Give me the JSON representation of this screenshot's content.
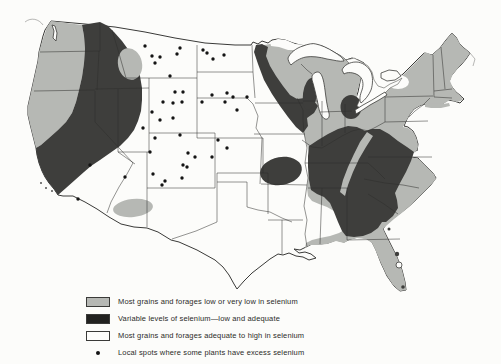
{
  "figure": {
    "map_type": "shaded-area map of the conterminous United States",
    "colors": {
      "low_or_very_low": "#b6b8b4",
      "variable": "#3e3e3c",
      "adequate_to_high": "#fcfcfa",
      "excess_spot": "#141414",
      "outline": "#3a3a38"
    },
    "legend": [
      {
        "swatch": "gray",
        "label": "Most grains and forages low or very low in selenium"
      },
      {
        "swatch": "black",
        "label": "Variable levels of selenium—low and adequate"
      },
      {
        "swatch": "white",
        "label": "Most grains and forages adequate to high in selenium"
      },
      {
        "swatch": "dot",
        "label": "Local spots where some plants have excess selenium"
      }
    ],
    "excess_selenium_spots": [
      [
        145,
        46
      ],
      [
        152,
        56
      ],
      [
        160,
        57
      ],
      [
        177,
        54
      ],
      [
        155,
        63
      ],
      [
        170,
        76
      ],
      [
        180,
        48
      ],
      [
        203,
        50
      ],
      [
        207,
        53
      ],
      [
        213,
        59
      ],
      [
        224,
        55
      ],
      [
        212,
        95
      ],
      [
        227,
        93
      ],
      [
        233,
        97
      ],
      [
        225,
        102
      ],
      [
        202,
        102
      ],
      [
        237,
        110
      ],
      [
        247,
        97
      ],
      [
        175,
        92
      ],
      [
        183,
        92
      ],
      [
        163,
        102
      ],
      [
        173,
        103
      ],
      [
        182,
        102
      ],
      [
        152,
        112
      ],
      [
        160,
        120
      ],
      [
        173,
        118
      ],
      [
        143,
        128
      ],
      [
        155,
        138
      ],
      [
        180,
        135
      ],
      [
        150,
        152
      ],
      [
        188,
        153
      ],
      [
        195,
        157
      ],
      [
        187,
        167
      ],
      [
        218,
        140
      ],
      [
        227,
        148
      ],
      [
        212,
        157
      ],
      [
        165,
        181
      ],
      [
        183,
        165
      ],
      [
        153,
        174
      ],
      [
        182,
        178
      ],
      [
        162,
        185
      ],
      [
        125,
        177
      ],
      [
        90,
        165
      ],
      [
        78,
        199
      ]
    ]
  }
}
